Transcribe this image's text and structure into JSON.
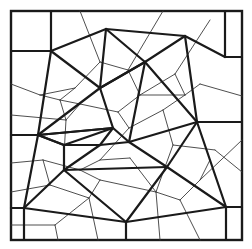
{
  "figure": {
    "type": "delaunay-voronoi-mesh",
    "colors": {
      "background": "#ffffff",
      "thick_edges": "#1a1a1a",
      "thin_edges": "#3a3a3a"
    },
    "frame": {
      "x1": 11,
      "y1": 11,
      "x2": 242,
      "y2": 240
    },
    "thick_edges": [
      [
        51,
        11,
        51,
        51
      ],
      [
        11,
        51,
        51,
        51
      ],
      [
        51,
        51,
        106,
        29
      ],
      [
        106,
        29,
        185,
        36
      ],
      [
        185,
        36,
        225,
        57
      ],
      [
        225,
        57,
        242,
        57
      ],
      [
        225,
        11,
        225,
        57
      ],
      [
        51,
        51,
        100,
        88
      ],
      [
        106,
        29,
        100,
        88
      ],
      [
        106,
        29,
        145,
        62
      ],
      [
        145,
        62,
        185,
        36
      ],
      [
        145,
        62,
        197,
        122
      ],
      [
        185,
        36,
        197,
        122
      ],
      [
        100,
        88,
        145,
        62
      ],
      [
        51,
        51,
        38,
        135
      ],
      [
        100,
        88,
        38,
        135
      ],
      [
        100,
        88,
        113,
        128
      ],
      [
        113,
        128,
        38,
        135
      ],
      [
        38,
        135,
        64,
        145
      ],
      [
        64,
        145,
        113,
        128
      ],
      [
        64,
        145,
        100,
        145
      ],
      [
        100,
        145,
        113,
        128
      ],
      [
        100,
        145,
        129,
        142
      ],
      [
        113,
        128,
        129,
        142
      ],
      [
        129,
        142,
        197,
        122
      ],
      [
        145,
        62,
        129,
        142
      ],
      [
        100,
        88,
        145,
        62
      ],
      [
        197,
        122,
        242,
        122
      ],
      [
        197,
        122,
        167,
        167
      ],
      [
        129,
        142,
        167,
        167
      ],
      [
        167,
        167,
        226,
        207
      ],
      [
        197,
        122,
        226,
        207
      ],
      [
        226,
        207,
        242,
        207
      ],
      [
        226,
        207,
        226,
        240
      ],
      [
        38,
        135,
        24,
        208
      ],
      [
        11,
        208,
        24,
        208
      ],
      [
        24,
        208,
        24,
        240
      ],
      [
        38,
        135,
        64,
        145
      ],
      [
        64,
        145,
        64,
        170
      ],
      [
        64,
        170,
        24,
        208
      ],
      [
        64,
        170,
        167,
        167
      ],
      [
        64,
        170,
        100,
        145
      ],
      [
        24,
        208,
        126,
        222
      ],
      [
        64,
        170,
        126,
        222
      ],
      [
        126,
        222,
        167,
        167
      ],
      [
        126,
        222,
        226,
        207
      ],
      [
        126,
        222,
        126,
        240
      ],
      [
        11,
        135,
        38,
        135
      ],
      [
        38,
        135,
        113,
        128
      ]
    ],
    "thin_edges": [
      [
        80,
        11,
        100,
        62
      ],
      [
        100,
        62,
        75,
        88
      ],
      [
        75,
        88,
        40,
        95
      ],
      [
        11,
        84,
        40,
        95
      ],
      [
        40,
        95,
        60,
        100
      ],
      [
        60,
        100,
        75,
        88
      ],
      [
        100,
        62,
        128,
        70
      ],
      [
        128,
        70,
        163,
        11
      ],
      [
        128,
        70,
        140,
        95
      ],
      [
        140,
        95,
        175,
        74
      ],
      [
        175,
        74,
        210,
        20
      ],
      [
        175,
        74,
        185,
        95
      ],
      [
        185,
        95,
        200,
        84
      ],
      [
        200,
        84,
        242,
        96
      ],
      [
        185,
        95,
        140,
        95
      ],
      [
        140,
        95,
        118,
        112
      ],
      [
        118,
        112,
        80,
        104
      ],
      [
        80,
        104,
        60,
        100
      ],
      [
        60,
        100,
        66,
        120
      ],
      [
        66,
        120,
        80,
        104
      ],
      [
        66,
        120,
        64,
        155
      ],
      [
        118,
        112,
        129,
        128
      ],
      [
        129,
        128,
        163,
        110
      ],
      [
        163,
        110,
        185,
        95
      ],
      [
        163,
        110,
        173,
        145
      ],
      [
        173,
        145,
        215,
        150
      ],
      [
        215,
        150,
        242,
        172
      ],
      [
        173,
        145,
        156,
        192
      ],
      [
        156,
        192,
        180,
        200
      ],
      [
        180,
        200,
        200,
        180
      ],
      [
        200,
        180,
        242,
        140
      ],
      [
        156,
        192,
        100,
        180
      ],
      [
        100,
        180,
        89,
        198
      ],
      [
        89,
        198,
        55,
        225
      ],
      [
        55,
        225,
        11,
        225
      ],
      [
        89,
        198,
        98,
        240
      ],
      [
        100,
        180,
        80,
        170
      ],
      [
        80,
        170,
        43,
        160
      ],
      [
        43,
        160,
        11,
        163
      ],
      [
        43,
        160,
        50,
        185
      ],
      [
        50,
        185,
        11,
        192
      ],
      [
        50,
        185,
        89,
        198
      ],
      [
        129,
        128,
        100,
        160
      ],
      [
        100,
        160,
        80,
        170
      ],
      [
        100,
        160,
        130,
        158
      ],
      [
        130,
        158,
        156,
        192
      ],
      [
        156,
        192,
        160,
        240
      ],
      [
        180,
        200,
        200,
        240
      ],
      [
        55,
        225,
        58,
        240
      ],
      [
        200,
        180,
        210,
        160
      ],
      [
        11,
        115,
        66,
        120
      ]
    ]
  }
}
